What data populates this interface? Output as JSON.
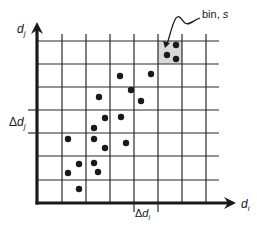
{
  "diagram": {
    "title": "",
    "y_axis_label": {
      "base": "d",
      "sub": "j"
    },
    "x_axis_label": {
      "base": "d",
      "sub": "i"
    },
    "delta_y_label": {
      "prefix": "Δ",
      "base": "d",
      "sub": "j"
    },
    "delta_x_label": {
      "prefix": "Δ",
      "base": "d",
      "sub": "i"
    },
    "callout": {
      "text_main": "bin, ",
      "text_var": "s"
    },
    "colors": {
      "ink": "#1a1a1a",
      "grid": "#2a2a2a",
      "bin_fill": "#d9d9d9",
      "background": "#ffffff"
    },
    "grid": {
      "x_lines": [
        62,
        86,
        110,
        134,
        158,
        182,
        206
      ],
      "y_lines": [
        41,
        64,
        87,
        110,
        133,
        156,
        180
      ],
      "x_axis_y": 203,
      "y_axis_x": 37,
      "right_edge": 219
    },
    "highlighted_bin": {
      "x": 158,
      "y": 41,
      "w": 24,
      "h": 23
    },
    "points": [
      [
        176,
        45
      ],
      [
        167,
        55
      ],
      [
        176,
        59
      ],
      [
        120,
        76
      ],
      [
        151,
        74
      ],
      [
        131,
        90
      ],
      [
        99,
        97
      ],
      [
        141,
        101
      ],
      [
        105,
        118
      ],
      [
        121,
        117
      ],
      [
        94,
        128
      ],
      [
        68,
        139
      ],
      [
        94,
        139
      ],
      [
        126,
        143
      ],
      [
        105,
        148
      ],
      [
        79,
        164
      ],
      [
        94,
        163
      ],
      [
        68,
        173
      ],
      [
        98,
        172
      ],
      [
        79,
        189
      ]
    ]
  }
}
